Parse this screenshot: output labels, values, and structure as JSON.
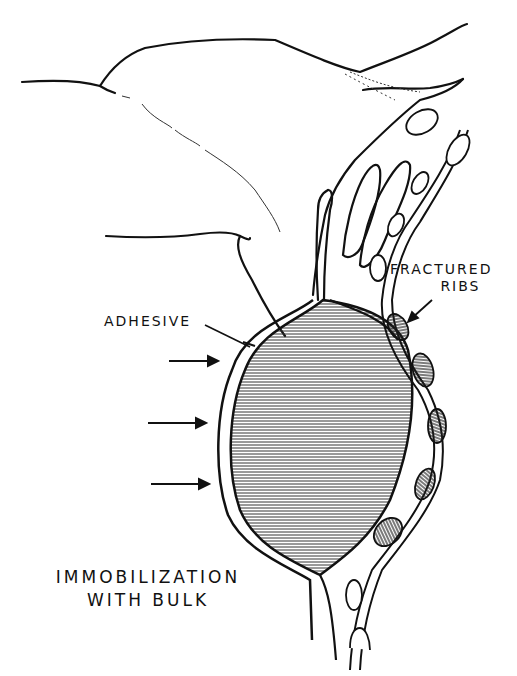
{
  "figure": {
    "title": "Immobilization with bulk",
    "labels": {
      "adhesive": "ADHESIVE",
      "fractured_line1": "FRACTURED",
      "fractured_line2": "RIBS",
      "caption_line1": "IMMOBILIZATION",
      "caption_line2": "WITH BULK"
    },
    "arrows": {
      "count": 3,
      "direction": "right"
    },
    "colors": {
      "ink": "#111111",
      "background": "#ffffff",
      "hatch": "#333333"
    }
  }
}
